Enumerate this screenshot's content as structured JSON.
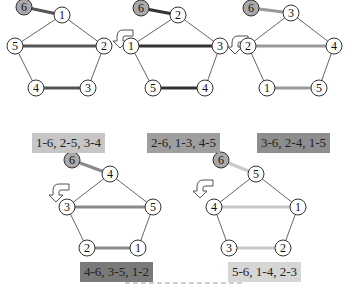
{
  "figure": {
    "panels": [
      {
        "id": 1,
        "label": "1-6, 2-5, 3-4",
        "label_bg": "#c6c6c6",
        "edge_color": "#555555",
        "has_rotate_arrow": false,
        "nodes": {
          "top": "1",
          "left": "5",
          "right": "2",
          "bottom_left": "4",
          "bottom_right": "3",
          "fixed": "6"
        }
      },
      {
        "id": 2,
        "label": "2-6, 1-3, 4-5",
        "label_bg": "#9e9e9e",
        "edge_color": "#333333",
        "has_rotate_arrow": true,
        "nodes": {
          "top": "2",
          "left": "1",
          "right": "3",
          "bottom_left": "5",
          "bottom_right": "4",
          "fixed": "6"
        }
      },
      {
        "id": 3,
        "label": "3-6, 2-4, 1-5",
        "label_bg": "#8e8e8e",
        "edge_color": "#9a9a9a",
        "has_rotate_arrow": true,
        "nodes": {
          "top": "3",
          "left": "2",
          "right": "4",
          "bottom_left": "1",
          "bottom_right": "5",
          "fixed": "6"
        }
      },
      {
        "id": 4,
        "label": "4-6, 3-5, 1-2",
        "label_bg": "#7a7a7a",
        "edge_color": "#8a8a8a",
        "has_rotate_arrow": true,
        "nodes": {
          "top": "4",
          "left": "3",
          "right": "5",
          "bottom_left": "2",
          "bottom_right": "1",
          "fixed": "6"
        }
      },
      {
        "id": 5,
        "label": "5-6, 1-4, 2-3",
        "label_bg": "#d6d6d6",
        "edge_color": "#c8c8c8",
        "has_rotate_arrow": true,
        "nodes": {
          "top": "5",
          "left": "4",
          "right": "1",
          "bottom_left": "3",
          "bottom_right": "2",
          "fixed": "6"
        }
      }
    ],
    "fixed_node_fill": "#a9a9a9"
  }
}
